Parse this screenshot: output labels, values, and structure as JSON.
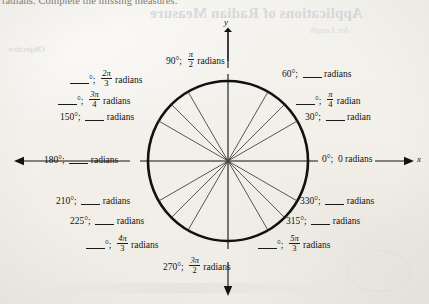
{
  "page": {
    "running_text": "radians. Complete the missing measures.",
    "ghost_heading": "Applications of Radian Measure",
    "ghost_sub_left": "Objective",
    "ghost_sub_right": "Arc Length"
  },
  "figure": {
    "name": "unit-circle-degree-radian-chart",
    "center": {
      "x": 228,
      "y": 161
    },
    "radius": 80,
    "spoke_count": 16,
    "spoke_angles_deg": [
      0,
      30,
      45,
      60,
      90,
      120,
      135,
      150,
      180,
      210,
      225,
      240,
      270,
      300,
      315,
      330
    ],
    "axis_labels": {
      "x": "x",
      "y": "y"
    },
    "colors": {
      "ink": "#121212",
      "circle": "#111111",
      "paper": "#f4f2ee",
      "ghost": "#cfd6dc"
    }
  },
  "labels": [
    {
      "id": "deg-90",
      "degrees": "90°",
      "separator": ";",
      "radians_num": "π",
      "radians_den": "2",
      "unit": "radians",
      "degrees_blank": false,
      "radians_blank": false
    },
    {
      "id": "deg-120",
      "degrees": "",
      "separator": ";",
      "radians_num": "2π",
      "radians_den": "3",
      "unit": "radians",
      "degrees_blank": true,
      "radians_blank": false
    },
    {
      "id": "deg-135",
      "degrees": "",
      "separator": ";",
      "radians_num": "3π",
      "radians_den": "4",
      "unit": "radians",
      "degrees_blank": true,
      "radians_blank": false
    },
    {
      "id": "deg-150",
      "degrees": "150°",
      "separator": ";",
      "radians_num": "",
      "radians_den": "",
      "unit": "radians",
      "degrees_blank": false,
      "radians_blank": true
    },
    {
      "id": "deg-180",
      "degrees": "180°",
      "separator": ";",
      "radians_num": "",
      "radians_den": "",
      "unit": "radians",
      "degrees_blank": false,
      "radians_blank": true
    },
    {
      "id": "deg-210",
      "degrees": "210°",
      "separator": ";",
      "radians_num": "",
      "radians_den": "",
      "unit": "radians",
      "degrees_blank": false,
      "radians_blank": true
    },
    {
      "id": "deg-225",
      "degrees": "225°",
      "separator": ";",
      "radians_num": "",
      "radians_den": "",
      "unit": "radians",
      "degrees_blank": false,
      "radians_blank": true
    },
    {
      "id": "deg-240",
      "degrees": "",
      "separator": ";",
      "radians_num": "4π",
      "radians_den": "3",
      "unit": "radians",
      "degrees_blank": true,
      "radians_blank": false
    },
    {
      "id": "deg-270",
      "degrees": "270°",
      "separator": ";",
      "radians_num": "3π",
      "radians_den": "2",
      "unit": "radians",
      "degrees_blank": false,
      "radians_blank": false
    },
    {
      "id": "deg-300",
      "degrees": "",
      "separator": ";",
      "radians_num": "5π",
      "radians_den": "3",
      "unit": "radians",
      "degrees_blank": true,
      "radians_blank": false
    },
    {
      "id": "deg-315",
      "degrees": "315°",
      "separator": ";",
      "radians_num": "",
      "radians_den": "",
      "unit": "radians",
      "degrees_blank": false,
      "radians_blank": true
    },
    {
      "id": "deg-330",
      "degrees": "330°",
      "separator": ";",
      "radians_num": "",
      "radians_den": "",
      "unit": "radians",
      "degrees_blank": false,
      "radians_blank": true
    },
    {
      "id": "deg-0",
      "degrees": "0°",
      "separator": ";",
      "radians_text": "0",
      "unit": "radians",
      "degrees_blank": false,
      "radians_blank": false
    },
    {
      "id": "deg-30",
      "degrees": "30°",
      "separator": ";",
      "radians_num": "",
      "radians_den": "",
      "unit": "radian",
      "degrees_blank": false,
      "radians_blank": true
    },
    {
      "id": "deg-45",
      "degrees": "",
      "separator": ";",
      "radians_num": "π",
      "radians_den": "4",
      "unit": "radian",
      "degrees_blank": true,
      "radians_blank": false
    },
    {
      "id": "deg-60",
      "degrees": "60°",
      "separator": ";",
      "radians_num": "",
      "radians_den": "",
      "unit": "radians",
      "degrees_blank": false,
      "radians_blank": true
    }
  ],
  "text": {
    "radians_word": "radians",
    "radian_word": "radian",
    "semicolon": ";",
    "zero_radians": "0 radians",
    "deg_90": "90°",
    "deg_150": "150°",
    "deg_180": "180°",
    "deg_210": "210°",
    "deg_225": "225°",
    "deg_270": "270°",
    "deg_315": "315°",
    "deg_330": "330°",
    "deg_0": "0°",
    "deg_30": "30°",
    "deg_60": "60°",
    "pi": "π",
    "two_pi": "2π",
    "three_pi": "3π",
    "four_pi": "4π",
    "five_pi": "5π",
    "den_2": "2",
    "den_3": "3",
    "den_4": "4",
    "x_axis": "x",
    "y_axis": "y"
  }
}
